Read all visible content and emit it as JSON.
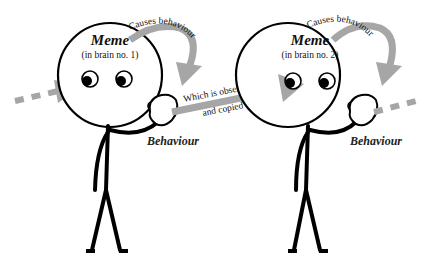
{
  "diagram": {
    "colors": {
      "arrow": "#a6a6a6",
      "stroke": "#000000",
      "background": "#ffffff"
    },
    "figures": [
      {
        "meme_label": "Meme",
        "brain_label": "(in brain no. 1)",
        "causes_label": "Causes behaviour",
        "behaviour_label": "Behaviour"
      },
      {
        "meme_label": "Meme",
        "brain_label": "(in brain no. 2)",
        "causes_label": "Causes behaviour",
        "behaviour_label": "Behaviour"
      }
    ],
    "transfer_arrow": {
      "line1": "Which is observed",
      "line2": "and copied"
    },
    "incoming_arrow": "dashed-arrow-in",
    "outgoing_arrow": "dashed-arrow-out"
  }
}
